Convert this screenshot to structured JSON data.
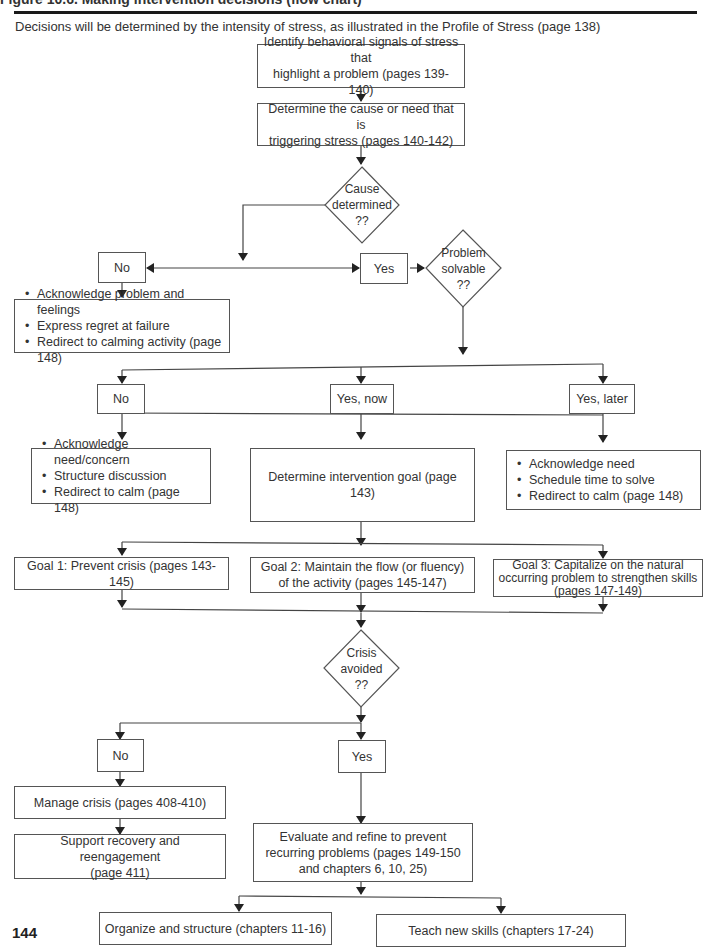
{
  "header": {
    "title": "Figure 10.6. Making intervention decisions (flow chart)",
    "intro": "Decisions will be determined by the intensity of stress, as illustrated in the Profile of Stress (page 138)"
  },
  "nodes": {
    "identify": "Identify behavioral signals of stress that highlight a problem (pages 139-140)",
    "identify_l1": "Identify behavioral signals of stress that",
    "identify_l2": "highlight a problem (pages 139-140)",
    "determine_l1": "Determine the cause or need that is",
    "determine_l2": "triggering stress (pages 140-142)",
    "cause_decision": [
      "Cause",
      "determined",
      "??"
    ],
    "cause_no": "No",
    "cause_yes": "Yes",
    "solvable_decision": [
      "Problem",
      "solvable",
      "??"
    ],
    "cause_no_actions": [
      "Acknowledge problem and feelings",
      "Express regret at failure",
      "Redirect to calming activity (page 148)"
    ],
    "solvable_no": "No",
    "solvable_yes_now": "Yes, now",
    "solvable_yes_later": "Yes, later",
    "solvable_no_actions": [
      "Acknowledge need/concern",
      "Structure discussion",
      "Redirect to calm (page 148)"
    ],
    "intervention_goal": "Determine intervention goal (page 143)",
    "solvable_later_actions": [
      "Acknowledge need",
      "Schedule time to solve",
      "Redirect to calm (page 148)"
    ],
    "goal1": "Goal 1: Prevent crisis (pages 143-145)",
    "goal2_l1": "Goal 2: Maintain the flow (or fluency)",
    "goal2_l2": "of the activity (pages 145-147)",
    "goal3_l1": "Goal 3: Capitalize on the natural",
    "goal3_l2": "occurring problem to strengthen skills",
    "goal3_l3": "(pages 147-149)",
    "crisis_decision": [
      "Crisis",
      "avoided",
      "??"
    ],
    "crisis_no": "No",
    "crisis_yes": "Yes",
    "manage_crisis": "Manage crisis (pages 408-410)",
    "support_l1": "Support recovery and reengagement",
    "support_l2": "(page 411)",
    "evaluate_l1": "Evaluate and refine to prevent",
    "evaluate_l2": "recurring problems (pages 149-150",
    "evaluate_l3": "and chapters 6, 10, 25)",
    "organize": "Organize and structure (chapters 11-16)",
    "teach": "Teach new skills (chapters 17-24)"
  },
  "footer": {
    "page_number": "144"
  }
}
